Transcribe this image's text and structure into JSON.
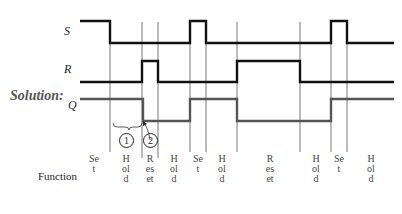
{
  "diagram": {
    "title_label": "Solution:",
    "signals": [
      {
        "name": "S",
        "label": "S"
      },
      {
        "name": "R",
        "label": "R"
      },
      {
        "name": "Q",
        "label": "Q"
      }
    ],
    "row_label": "Function",
    "boundaries_x": [
      110,
      142,
      158,
      190,
      206,
      237,
      300,
      331,
      347
    ],
    "functions": [
      {
        "text": "Set"
      },
      {
        "text": "Hold"
      },
      {
        "text": "Reset"
      },
      {
        "text": "Hold"
      },
      {
        "text": "Set"
      },
      {
        "text": "Hold"
      },
      {
        "text": "Reset"
      },
      {
        "text": "Hold"
      },
      {
        "text": "Set"
      },
      {
        "text": "Hold"
      }
    ],
    "annotations": [
      {
        "label": "1",
        "note": "brace over Hold interval"
      },
      {
        "label": "2",
        "note": "arrow to Q falling edge"
      }
    ],
    "colors": {
      "signal": "#111111",
      "q_signal": "#555555",
      "gridline": "#777777"
    }
  }
}
